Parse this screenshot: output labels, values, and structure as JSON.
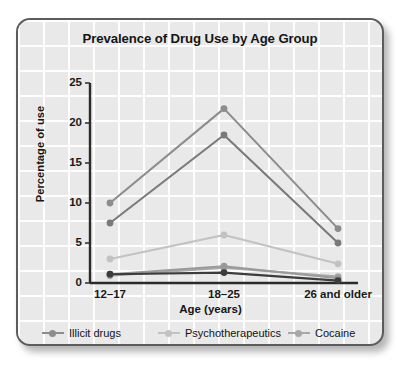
{
  "chart_data": {
    "type": "line",
    "title": "Prevalence of Drug Use by Age Group",
    "xlabel": "Age (years)",
    "ylabel": "Percentage of use",
    "categories": [
      "12–17",
      "18–25",
      "26 and older"
    ],
    "ylim": [
      0,
      25
    ],
    "yticks": [
      0,
      5,
      10,
      15,
      20,
      25
    ],
    "ytick_labels": [
      "0",
      "5",
      "10",
      "15",
      "20",
      "25"
    ],
    "grid": true,
    "legend_position": "bottom",
    "series": [
      {
        "name": "Illicit drugs",
        "values": [
          10.0,
          21.8,
          6.8
        ],
        "color": "#8d8d8d"
      },
      {
        "name": "Psychotherapeutics",
        "values": [
          3.0,
          6.0,
          2.4
        ],
        "color": "#c2c2c2"
      },
      {
        "name": "Cocaine",
        "values": [
          0.9,
          1.9,
          0.8
        ],
        "color": "#a8a8a8"
      },
      {
        "name": "Marijuana",
        "values": [
          7.5,
          18.5,
          5.0
        ],
        "color": "#7a7a7a"
      },
      {
        "name": "Hallucinogens",
        "values": [
          1.1,
          2.1,
          0.6
        ],
        "color": "#9a9a9a"
      },
      {
        "name": "Inhalants",
        "values": [
          1.1,
          1.3,
          0.3
        ],
        "color": "#3c3c3c"
      }
    ]
  },
  "colors": {
    "card_background": "#e9e9e9",
    "card_border": "#5c5c5c",
    "grid_line": "#ffffff",
    "axis_line": "#2b2b2b",
    "text": "#151515"
  }
}
